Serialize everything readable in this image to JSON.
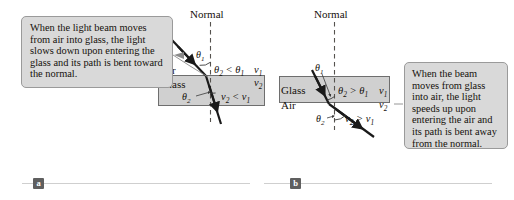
{
  "figure": {
    "background_color": "#ffffff",
    "medium_fill_color": "#d0d0d0",
    "callout_fill_color": "#d9d9d9",
    "callout_border_color": "#9a9a9a",
    "ray_color": "#1a1a1a",
    "rule_color": "#cfcfcf",
    "badge_color": "#5f5f5f"
  },
  "panel_a": {
    "part_label": "a",
    "callout_text": "When the light beam moves from air into glass, the light slows down upon entering the glass and its path is bent toward the normal.",
    "normal_label": "Normal",
    "upper_medium": "Air",
    "lower_medium": "Glass",
    "angle_incidence": "θ1",
    "angle_refraction": "θ2",
    "angle_relation": "θ2 < θ1",
    "speed_upper": "v1",
    "speed_lower": "v2",
    "speed_relation": "v2 < v1",
    "description": "Ray travels from air into glass and bends toward the normal"
  },
  "panel_b": {
    "part_label": "b",
    "callout_text": "When the beam moves from glass into air, the light speeds up upon entering the air and its path is bent away from the normal.",
    "normal_label": "Normal",
    "upper_medium": "Glass",
    "lower_medium": "Air",
    "angle_incidence": "θ1",
    "angle_refraction": "θ2",
    "angle_relation": "θ2 > θ1",
    "speed_upper": "v1",
    "speed_lower": "v2",
    "speed_relation": "v2 > v1",
    "description": "Ray travels from glass into air and bends away from the normal"
  }
}
